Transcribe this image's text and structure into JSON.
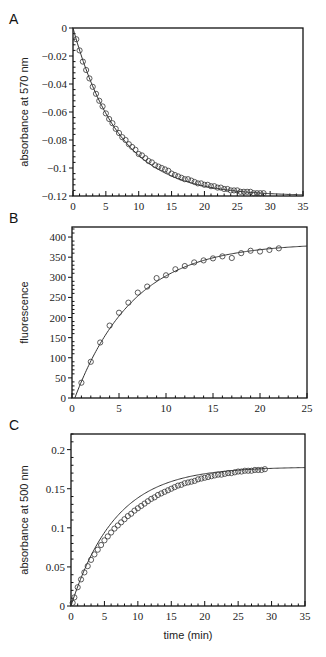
{
  "chart_data": [
    {
      "panel": "A",
      "type": "scatter",
      "title": "",
      "xlabel": "",
      "ylabel": "absorbance at 570 nm",
      "xlim": [
        0,
        35
      ],
      "ylim": [
        -0.12,
        0
      ],
      "xticks": [
        0,
        5,
        10,
        15,
        20,
        25,
        30,
        35
      ],
      "yticks": [
        0,
        -0.02,
        -0.04,
        -0.06,
        -0.08,
        -0.1,
        -0.12
      ],
      "ytick_labels": [
        "0",
        "−0.02",
        "−0.04",
        "−0.06",
        "−0.08",
        "−0.1",
        "−0.12"
      ],
      "grid": false,
      "legend": null,
      "fit": {
        "model": "exponential",
        "amplitude": -0.12,
        "k": 0.142,
        "x_end": 35
      },
      "series": [
        {
          "name": "data",
          "marker": "open-circle",
          "x": [
            0.5,
            1,
            1.5,
            2,
            2.5,
            3,
            3.5,
            4,
            4.5,
            5,
            5.5,
            6,
            6.5,
            7,
            7.5,
            8,
            8.5,
            9,
            9.5,
            10,
            10.5,
            11,
            11.5,
            12,
            12.5,
            13,
            13.5,
            14,
            14.5,
            15,
            15.5,
            16,
            16.5,
            17,
            17.5,
            18,
            18.5,
            19,
            19.5,
            20,
            20.5,
            21,
            21.5,
            22,
            22.5,
            23,
            23.5,
            24,
            24.5,
            25,
            25.5,
            26,
            26.5,
            27,
            27.5,
            28,
            28.5,
            29
          ],
          "y": [
            -0.008,
            -0.016,
            -0.024,
            -0.03,
            -0.036,
            -0.042,
            -0.047,
            -0.052,
            -0.056,
            -0.061,
            -0.065,
            -0.068,
            -0.072,
            -0.075,
            -0.078,
            -0.08,
            -0.083,
            -0.085,
            -0.087,
            -0.09,
            -0.091,
            -0.093,
            -0.095,
            -0.096,
            -0.098,
            -0.099,
            -0.1,
            -0.101,
            -0.102,
            -0.104,
            -0.105,
            -0.106,
            -0.107,
            -0.108,
            -0.108,
            -0.109,
            -0.11,
            -0.111,
            -0.111,
            -0.112,
            -0.112,
            -0.113,
            -0.113,
            -0.114,
            -0.114,
            -0.115,
            -0.115,
            -0.116,
            -0.116,
            -0.116,
            -0.117,
            -0.117,
            -0.117,
            -0.117,
            -0.118,
            -0.118,
            -0.118,
            -0.118
          ]
        }
      ]
    },
    {
      "panel": "B",
      "type": "scatter",
      "title": "",
      "xlabel": "",
      "ylabel": "fluorescence",
      "xlim": [
        0,
        25
      ],
      "ylim": [
        0,
        425
      ],
      "xticks": [
        0,
        5,
        10,
        15,
        20,
        25
      ],
      "yticks": [
        0,
        50,
        100,
        150,
        200,
        250,
        300,
        350,
        400
      ],
      "ytick_labels": [
        "0",
        "50",
        "100",
        "150",
        "200",
        "250",
        "300",
        "350",
        "400"
      ],
      "grid": false,
      "legend": null,
      "fit": {
        "model": "exponential-rise",
        "amplitude": 385,
        "k": 0.16,
        "x0": 0.3,
        "x_end": 25
      },
      "series": [
        {
          "name": "data",
          "marker": "open-circle",
          "x": [
            1,
            2,
            3,
            4,
            5,
            6,
            7,
            8,
            9,
            10,
            11,
            12,
            13,
            14,
            15,
            16,
            17,
            18,
            19,
            20,
            21,
            22
          ],
          "y": [
            38,
            90,
            138,
            180,
            212,
            237,
            262,
            277,
            298,
            305,
            320,
            328,
            337,
            342,
            347,
            352,
            348,
            360,
            366,
            364,
            368,
            372
          ]
        }
      ]
    },
    {
      "panel": "C",
      "type": "scatter",
      "title": "",
      "xlabel": "time (min)",
      "ylabel": "absorbance at 500 nm",
      "xlim": [
        0,
        35
      ],
      "ylim": [
        0,
        0.22
      ],
      "xticks": [
        0,
        5,
        10,
        15,
        20,
        25,
        30,
        35
      ],
      "yticks": [
        0,
        0.05,
        0.1,
        0.15,
        0.2
      ],
      "ytick_labels": [
        "0",
        "0.05",
        "0.1",
        "0.15",
        "0.2"
      ],
      "grid": false,
      "legend": null,
      "fit": {
        "model": "exponential-rise",
        "amplitude": 0.178,
        "k": 0.15,
        "x0": 0,
        "x_end": 35
      },
      "series": [
        {
          "name": "data",
          "marker": "open-circle",
          "x": [
            0.25,
            0.5,
            1,
            1.5,
            2,
            2.5,
            3,
            3.5,
            4,
            4.5,
            5,
            5.5,
            6,
            6.5,
            7,
            7.5,
            8,
            8.5,
            9,
            9.5,
            10,
            10.5,
            11,
            11.5,
            12,
            12.5,
            13,
            13.5,
            14,
            14.5,
            15,
            15.5,
            16,
            16.5,
            17,
            17.5,
            18,
            18.5,
            19,
            19.5,
            20,
            20.5,
            21,
            21.5,
            22,
            22.5,
            23,
            23.5,
            24,
            24.5,
            25,
            25.5,
            26,
            26.5,
            27,
            27.5,
            28,
            28.5,
            29
          ],
          "y": [
            0.004,
            0.011,
            0.024,
            0.034,
            0.043,
            0.051,
            0.059,
            0.066,
            0.072,
            0.078,
            0.084,
            0.089,
            0.094,
            0.099,
            0.103,
            0.107,
            0.111,
            0.115,
            0.118,
            0.122,
            0.125,
            0.128,
            0.131,
            0.134,
            0.137,
            0.139,
            0.142,
            0.144,
            0.146,
            0.148,
            0.15,
            0.152,
            0.154,
            0.155,
            0.157,
            0.158,
            0.159,
            0.16,
            0.162,
            0.163,
            0.164,
            0.165,
            0.166,
            0.167,
            0.168,
            0.168,
            0.169,
            0.17,
            0.17,
            0.171,
            0.172,
            0.172,
            0.173,
            0.173,
            0.173,
            0.174,
            0.174,
            0.174,
            0.175
          ]
        }
      ]
    }
  ],
  "panels": [
    {
      "letter": "A",
      "box": {
        "x": 73,
        "y": 28,
        "w": 230,
        "h": 168
      },
      "ylabel_x": 28
    },
    {
      "letter": "B",
      "box": {
        "x": 72,
        "y": 227,
        "w": 235,
        "h": 171
      },
      "ylabel_x": 28
    },
    {
      "letter": "C",
      "box": {
        "x": 71,
        "y": 434,
        "w": 234,
        "h": 172
      },
      "ylabel_x": 28
    }
  ],
  "colors": {
    "axis": "#111111",
    "fit_line": "#333333",
    "marker": "#333333",
    "text": "#222222"
  }
}
